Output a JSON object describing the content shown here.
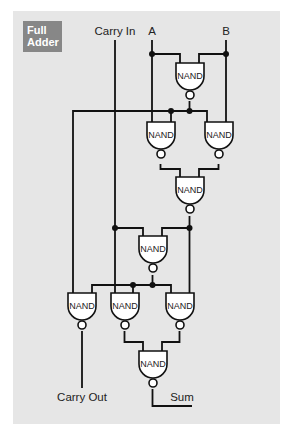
{
  "title": {
    "line1": "Full",
    "line2": "Adder"
  },
  "labels": {
    "carry_in": "Carry In",
    "input_a": "A",
    "input_b": "B",
    "carry_out": "Carry Out",
    "sum": "Sum"
  },
  "gate_label": "NAND",
  "gates": [
    {
      "id": "g1",
      "label": "NAND"
    },
    {
      "id": "g2",
      "label": "NAND"
    },
    {
      "id": "g3",
      "label": "NAND"
    },
    {
      "id": "g4",
      "label": "NAND"
    },
    {
      "id": "g5",
      "label": "NAND"
    },
    {
      "id": "g6",
      "label": "NAND"
    },
    {
      "id": "g7",
      "label": "NAND"
    },
    {
      "id": "g8",
      "label": "NAND"
    },
    {
      "id": "g9",
      "label": "NAND"
    }
  ],
  "colors": {
    "panel": "#e6e6e6",
    "badge": "#878787",
    "wire": "#111111",
    "gate_fill": "#ffffff"
  }
}
